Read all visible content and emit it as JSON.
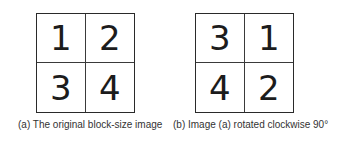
{
  "figure_a": {
    "cells": [
      "1",
      "2",
      "3",
      "4"
    ],
    "caption": "(a) The original block-size image"
  },
  "figure_b": {
    "cells": [
      "3",
      "1",
      "4",
      "2"
    ],
    "caption": "(b) Image (a) rotated clockwise 90°"
  }
}
